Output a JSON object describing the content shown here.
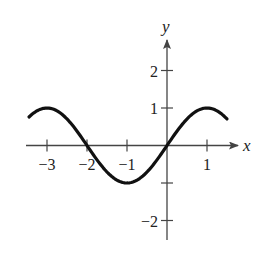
{
  "chart_data": {
    "type": "line",
    "title": "",
    "function": "y = sin(pi*x/2)",
    "xlabel": "x",
    "ylabel": "y",
    "xlim": [
      -3.45,
      1.5
    ],
    "ylim": [
      -2.5,
      2.8
    ],
    "grid": false,
    "legend": null,
    "x_ticks": [
      -3,
      -2,
      -1,
      1
    ],
    "x_tick_labels": [
      "−3",
      "−2",
      "−1",
      "1"
    ],
    "y_ticks": [
      -2,
      -1,
      1,
      2
    ],
    "y_tick_labels": [
      "−2",
      "",
      "1",
      "2"
    ],
    "series": [
      {
        "name": "curve",
        "x": [
          -3.45,
          -3,
          -2.5,
          -2,
          -1.5,
          -1,
          -0.5,
          0,
          0.5,
          1,
          1.5
        ],
        "values": [
          0.77,
          1,
          0.71,
          0,
          -0.71,
          -1,
          -0.71,
          0,
          0.71,
          1,
          0.71
        ]
      }
    ],
    "key_points": {
      "maxima": [
        [
          -3,
          1
        ],
        [
          1,
          1
        ]
      ],
      "minima": [
        [
          -1,
          -1
        ]
      ],
      "zeros": [
        [
          -2,
          0
        ],
        [
          0,
          0
        ]
      ]
    },
    "colors": {
      "curve": "#111111",
      "axes": "#444444",
      "text": "#222222"
    }
  }
}
